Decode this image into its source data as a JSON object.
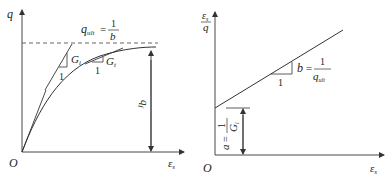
{
  "left_panel": {
    "y_axis_label": "q",
    "x_axis_label": "ε",
    "x_axis_sub": "s",
    "origin_label": "O",
    "asymptote_label": {
      "var": "q",
      "sub": "ult",
      "eq": "=",
      "num": "1",
      "den": "b"
    },
    "initial_slope": {
      "run": "1",
      "label": "G",
      "sub": "i"
    },
    "tangent_slope": {
      "run": "1",
      "label": "G",
      "sub": "t"
    },
    "failure_label": {
      "var": "q",
      "sub": "f"
    }
  },
  "right_panel": {
    "y_axis_label_num": "ε",
    "y_axis_label_num_sub": "s",
    "y_axis_label_den": "q",
    "x_axis_label": "ε",
    "x_axis_sub": "s",
    "origin_label": "O",
    "slope_label": {
      "run": "1",
      "var": "b",
      "eq": "=",
      "num": "1",
      "den": "q",
      "den_sub": "ult"
    },
    "intercept_label": {
      "var": "a",
      "eq": "=",
      "num": "1",
      "den": "G",
      "den_sub": "i"
    }
  },
  "colors": {
    "line": "#333333",
    "text": "#222222"
  }
}
